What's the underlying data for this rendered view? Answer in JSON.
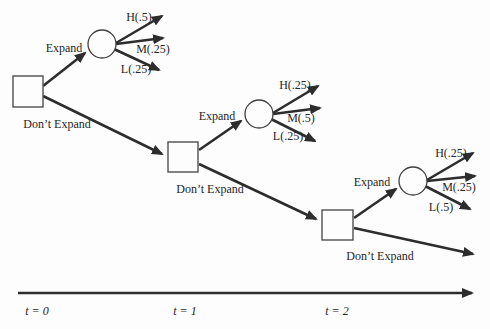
{
  "figure": {
    "type": "decision-tree",
    "colors": {
      "ink": "#2d2d2d",
      "node_stroke": "#4f4f4f",
      "text": "#262626",
      "background": "#fdfdfd"
    },
    "stages": [
      {
        "time_label": "t = 0",
        "expand_label": "Expand",
        "dont_expand_label": "Don’t Expand",
        "outcomes": [
          {
            "label": "H(.5)",
            "probability": 0.5
          },
          {
            "label": "M(.25)",
            "probability": 0.25
          },
          {
            "label": "L(.25)",
            "probability": 0.25
          }
        ]
      },
      {
        "time_label": "t = 1",
        "expand_label": "Expand",
        "dont_expand_label": "Don’t Expand",
        "outcomes": [
          {
            "label": "H(.25)",
            "probability": 0.25
          },
          {
            "label": "M(.5)",
            "probability": 0.5
          },
          {
            "label": "L(.25)",
            "probability": 0.25
          }
        ]
      },
      {
        "time_label": "t = 2",
        "expand_label": "Expand",
        "dont_expand_label": "Don’t Expand",
        "outcomes": [
          {
            "label": "H(.25)",
            "probability": 0.25
          },
          {
            "label": "M(.25)",
            "probability": 0.25
          },
          {
            "label": "L(.5)",
            "probability": 0.5
          }
        ]
      }
    ]
  }
}
